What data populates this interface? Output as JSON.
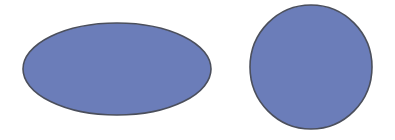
{
  "canvas": {
    "width": 395,
    "height": 140,
    "background": "#ffffff"
  },
  "colors": {
    "fill": "#6b7db9",
    "stroke": "#4b4f5c"
  },
  "shapes": [
    {
      "type": "ellipse",
      "name": "ellipse-shape",
      "cx": 117,
      "cy": 69,
      "rx": 94,
      "ry": 46
    },
    {
      "type": "circle",
      "name": "circle-shape",
      "cx": 311,
      "cy": 67,
      "rx": 61,
      "ry": 62
    }
  ]
}
